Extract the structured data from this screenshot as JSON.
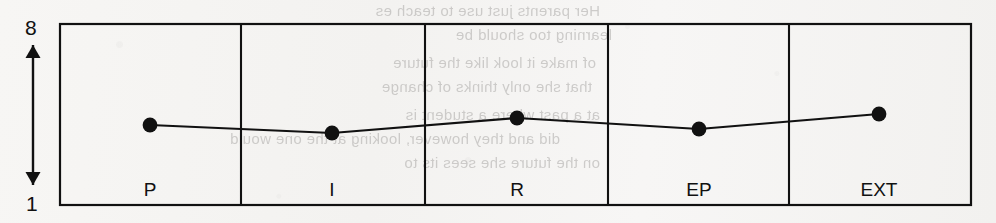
{
  "figure": {
    "background_color": "#f6f5f3",
    "ink_color": "#111111"
  },
  "y_axis": {
    "name": "vertical-double-arrow-scale",
    "top_label": "8",
    "bottom_label": "1",
    "arrow_style": "double-headed",
    "x_px": 33,
    "top_px": 45,
    "bottom_px": 185
  },
  "plot_box": {
    "left_px": 60,
    "top_px": 24,
    "right_px": 971,
    "bottom_px": 205,
    "border_color": "#111111",
    "divider_x_px": [
      241,
      425,
      608,
      789
    ]
  },
  "bleed_through_text": [
    {
      "text": "Her parents just use to teach es",
      "x": 600,
      "y": 2
    },
    {
      "text": "learning too should be",
      "x": 612,
      "y": 26
    },
    {
      "text": "of make it look like the future",
      "x": 596,
      "y": 54
    },
    {
      "text": "that she only thinks of change",
      "x": 592,
      "y": 78
    },
    {
      "text": "at a past where a student is",
      "x": 600,
      "y": 106
    },
    {
      "text": "did and they however, looking at the one would",
      "x": 560,
      "y": 130
    },
    {
      "text": "on the future she sees its to",
      "x": 600,
      "y": 154
    }
  ],
  "chart_data": {
    "type": "line",
    "title": "",
    "xlabel": "",
    "ylabel": "",
    "ylim": [
      1,
      8
    ],
    "y_tick_labels": [
      "8",
      "1"
    ],
    "grid": "vertical panel dividers only",
    "legend": "none",
    "marker": "filled-circle",
    "categories": [
      "P",
      "I",
      "R",
      "EP",
      "EXT"
    ],
    "values": [
      4.3,
      3.9,
      4.4,
      4.0,
      4.6
    ],
    "points_px": [
      {
        "category": "P",
        "x": 150,
        "y": 125,
        "value": 4.3
      },
      {
        "category": "I",
        "x": 332,
        "y": 133,
        "value": 3.9
      },
      {
        "category": "R",
        "x": 517,
        "y": 118,
        "value": 4.4
      },
      {
        "category": "EP",
        "x": 699,
        "y": 129,
        "value": 4.0
      },
      {
        "category": "EXT",
        "x": 879,
        "y": 114,
        "value": 4.6
      }
    ],
    "category_label_positions_px": [
      {
        "label": "P",
        "x": 150,
        "y": 180
      },
      {
        "label": "I",
        "x": 332,
        "y": 180
      },
      {
        "label": "R",
        "x": 517,
        "y": 180
      },
      {
        "label": "EP",
        "x": 699,
        "y": 180
      },
      {
        "label": "EXT",
        "x": 879,
        "y": 180
      }
    ]
  }
}
